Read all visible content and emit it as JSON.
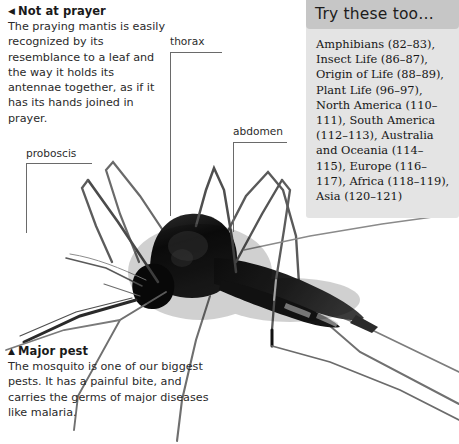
{
  "page": {
    "width": 459,
    "height": 444,
    "background": "#ffffff"
  },
  "captions": [
    {
      "id": "not-at-prayer",
      "marker": "◀",
      "marker_name": "triangle-left-icon",
      "heading": "Not at prayer",
      "body": "The praying mantis is easily recognized by its resemblance to a leaf and the way it holds its antennae together, as if it has its hands joined in prayer."
    },
    {
      "id": "major-pest",
      "marker": "▲",
      "marker_name": "triangle-up-icon",
      "heading": "Major pest",
      "body": "The mosquito is one of our biggest pests. It has a painful bite, and carries the germs of major diseases like malaria."
    }
  ],
  "annotations": [
    {
      "id": "proboscis",
      "label": "proboscis"
    },
    {
      "id": "thorax",
      "label": "thorax"
    },
    {
      "id": "abdomen",
      "label": "abdomen"
    }
  ],
  "side_panel": {
    "title": "Try these too…",
    "header_color": "#c6c6c6",
    "body_color": "#e4e4e4",
    "entries_text": "Amphibians (82–83), Insect Life (86–87), Origin of Life (88–89), Plant Life (96–97), North America (110–111), South America (112–113), Australia and Oceania (114–115), Europe (116–117), Africa (118–119), Asia (120–121)",
    "entries": [
      {
        "name": "Amphibians",
        "pages": "82–83"
      },
      {
        "name": "Insect Life",
        "pages": "86–87"
      },
      {
        "name": "Origin of Life",
        "pages": "88–89"
      },
      {
        "name": "Plant Life",
        "pages": "96–97"
      },
      {
        "name": "North America",
        "pages": "110–111"
      },
      {
        "name": "South America",
        "pages": "112–113"
      },
      {
        "name": "Australia and Oceania",
        "pages": "114–115"
      },
      {
        "name": "Europe",
        "pages": "116–117"
      },
      {
        "name": "Africa",
        "pages": "118–119"
      },
      {
        "name": "Asia",
        "pages": "120–121"
      }
    ]
  }
}
